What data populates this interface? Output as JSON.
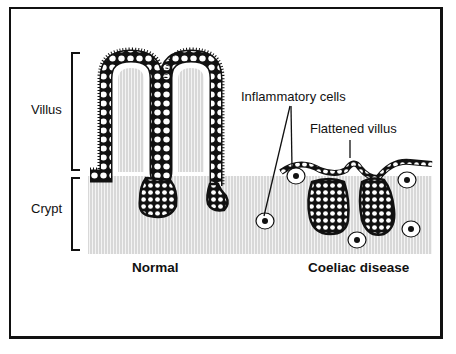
{
  "diagram": {
    "labels": {
      "villus": "Villus",
      "crypt": "Crypt",
      "inflammatory_cells": "Inflammatory cells",
      "flattened_villus": "Flattened villus",
      "normal": "Normal",
      "coeliac_disease": "Coeliac disease"
    },
    "colors": {
      "line": "#111111",
      "background": "#ffffff",
      "stroma_hatch": "#c8c8c8"
    }
  }
}
